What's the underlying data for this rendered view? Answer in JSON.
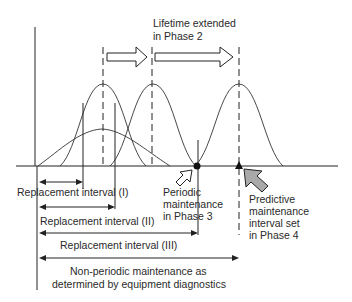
{
  "diagram": {
    "labels": {
      "lifetime_line1": "Lifetime extended",
      "lifetime_line2": "in Phase 2",
      "replacement_1": "Replacement interval (I)",
      "replacement_2": "Replacement interval (II)",
      "replacement_3": "Replacement interval (III)",
      "periodic_line1": "Periodic",
      "periodic_line2": "maintenance",
      "periodic_line3": "in Phase 3",
      "predictive_line1": "Predictive",
      "predictive_line2": "maintenance",
      "predictive_line3": "interval set",
      "predictive_line4": "in Phase 4",
      "nonperiodic_line1": "Non-periodic maintenance as",
      "nonperiodic_line2": "determined by equipment diagnostics"
    },
    "colors": {
      "ink": "#222222",
      "predictive_arrow_fill": "#a9a9a9",
      "hollow_arrow_fill": "#ffffff"
    }
  }
}
